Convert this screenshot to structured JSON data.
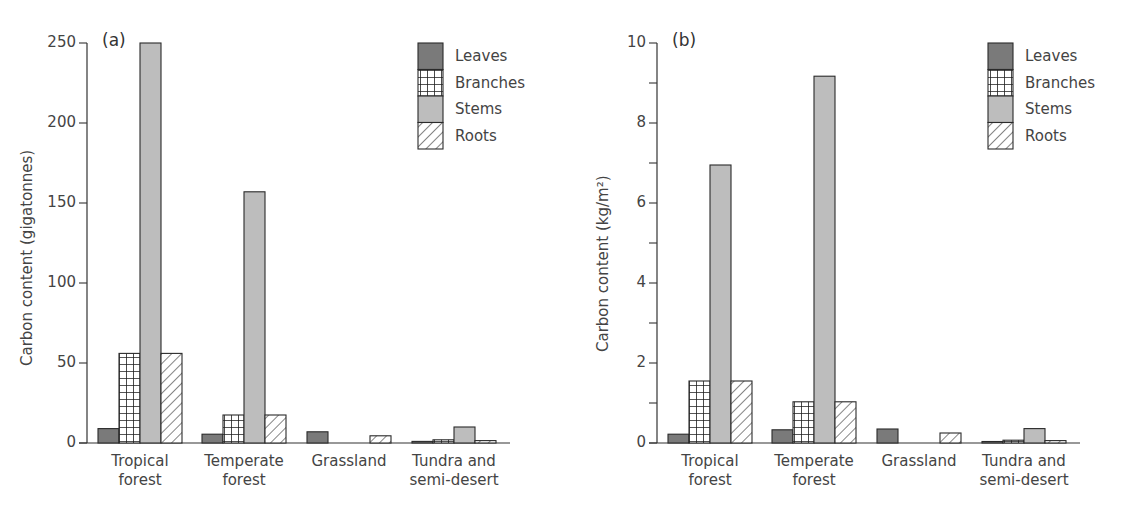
{
  "chart_data": [
    {
      "type": "bar",
      "panel_tag": "(a)",
      "title": "",
      "xlabel": "",
      "ylabel": "Carbon content (gigatonnes)",
      "ylim": [
        0,
        250
      ],
      "yticks": [
        0,
        50,
        100,
        150,
        200,
        250
      ],
      "ytick_labels": [
        "0",
        "50",
        "100",
        "150",
        "200",
        "250"
      ],
      "grid": false,
      "legend_position": "upper right",
      "categories": [
        "Tropical forest",
        "Temperate forest",
        "Grassland",
        "Tundra and semi-desert"
      ],
      "category_lines": [
        [
          "Tropical",
          "forest"
        ],
        [
          "Temperate",
          "forest"
        ],
        [
          "Grassland",
          ""
        ],
        [
          "Tundra and",
          "semi-desert"
        ]
      ],
      "series": [
        {
          "name": "Leaves",
          "pattern": "dark-grey-fill",
          "values": [
            9,
            5.5,
            7,
            1
          ]
        },
        {
          "name": "Branches",
          "pattern": "grid-hatch",
          "values": [
            56,
            17.5,
            0,
            2
          ]
        },
        {
          "name": "Stems",
          "pattern": "light-grey-fill",
          "values": [
            250,
            157,
            0,
            10
          ]
        },
        {
          "name": "Roots",
          "pattern": "diagonal-hatch",
          "values": [
            56,
            17.5,
            4.5,
            1.5
          ]
        }
      ]
    },
    {
      "type": "bar",
      "panel_tag": "(b)",
      "title": "",
      "xlabel": "",
      "ylabel": "Carbon content (kg/m²)",
      "ylim": [
        0,
        10
      ],
      "yticks": [
        0,
        1,
        2,
        3,
        4,
        5,
        6,
        7,
        8,
        9,
        10
      ],
      "ytick_labels": [
        "0",
        "",
        "2",
        "",
        "4",
        "",
        "6",
        "",
        "8",
        "",
        "10"
      ],
      "grid": false,
      "legend_position": "upper right",
      "categories": [
        "Tropical forest",
        "Temperate forest",
        "Grassland",
        "Tundra and semi-desert"
      ],
      "category_lines": [
        [
          "Tropical",
          "forest"
        ],
        [
          "Temperate",
          "forest"
        ],
        [
          "Grassland",
          ""
        ],
        [
          "Tundra and",
          "semi-desert"
        ]
      ],
      "series": [
        {
          "name": "Leaves",
          "pattern": "dark-grey-fill",
          "values": [
            0.22,
            0.33,
            0.35,
            0.03
          ]
        },
        {
          "name": "Branches",
          "pattern": "grid-hatch",
          "values": [
            1.55,
            1.03,
            0,
            0.07
          ]
        },
        {
          "name": "Stems",
          "pattern": "light-grey-fill",
          "values": [
            6.95,
            9.17,
            0,
            0.36
          ]
        },
        {
          "name": "Roots",
          "pattern": "diagonal-hatch",
          "values": [
            1.55,
            1.03,
            0.25,
            0.06
          ]
        }
      ]
    }
  ],
  "colors": {
    "leaves": "#7a7a7a",
    "stems": "#bdbdbd",
    "outline": "#2a2a2a",
    "text": "#444444"
  },
  "panels": [
    {
      "tag": "(a)",
      "ylabel": "Carbon content  (gigatonnes)"
    },
    {
      "tag": "(b)",
      "ylabel": "Carbon  content  (kg/m²)"
    }
  ],
  "legend": [
    "Leaves",
    "Branches",
    "Stems",
    "Roots"
  ]
}
